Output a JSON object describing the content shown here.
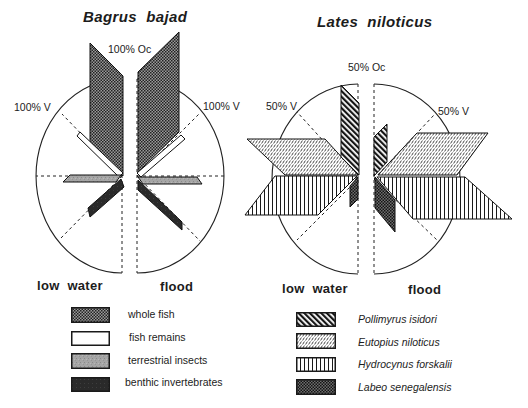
{
  "panels": {
    "bagrus": {
      "title": "Bagrus  bajad",
      "oc_label": "100% Oc",
      "v_label_left": "100% V",
      "v_label_right": "100% V",
      "season_left": "low  water",
      "season_right": "flood"
    },
    "lates": {
      "title": "Lates  niloticus",
      "oc_label": "50% Oc",
      "v_label_left": "50% V",
      "v_label_right": "50% V",
      "season_left": "low  water",
      "season_right": "flood"
    }
  },
  "legends": {
    "bagrus": [
      {
        "label": "whole fish",
        "pattern": "whole-fish"
      },
      {
        "label": "fish remains",
        "pattern": "fish-remains"
      },
      {
        "label": "terrestrial insects",
        "pattern": "terrestrial-insects"
      },
      {
        "label": "benthic invertebrates",
        "pattern": "benthic-invertebrates"
      }
    ],
    "lates": [
      {
        "label": "Pollimyrus isidori",
        "pattern": "pollimyrus-isidori"
      },
      {
        "label": "Eutopius niloticus",
        "pattern": "eutopius-niloticus"
      },
      {
        "label": "Hydrocynus forskalii",
        "pattern": "hydrocynus-forskalii"
      },
      {
        "label": "Labeo senegalensis",
        "pattern": "labeo-senegalensis"
      }
    ]
  },
  "chart_data": [
    {
      "id": "bagrus",
      "type": "bar",
      "subtype": "paired semicircular prey-importance diagram (polar parallelogram bars)",
      "title": "Bagrus bajad",
      "axis_labels": {
        "vertical": "100% Oc",
        "diagonal": "100% V"
      },
      "scale": {
        "Oc_max": 100,
        "V_max": 100
      },
      "halves": [
        {
          "season": "low water",
          "side": "left",
          "center": [
            122,
            176
          ],
          "rx": 86,
          "ry": 97,
          "rays": [
            [
              36,
              176
            ],
            [
              62,
              114
            ],
            [
              61,
              238
            ]
          ],
          "items": [
            {
              "category": "whole fish",
              "pattern": "whole-fish",
              "direction": "vertical (Oc axis)",
              "approx_extent_rel_radius": 1.4,
              "polygon": [
                [
                  90,
                  43
                ],
                [
                  123,
                  76
                ],
                [
                  123,
                  176
                ],
                [
                  90,
                  142
                ]
              ]
            },
            {
              "category": "fish remains",
              "pattern": "fish-remains",
              "direction": "45deg up",
              "approx_extent_rel_radius": 0.71,
              "polygon": [
                [
                  77,
                  136
                ],
                [
                  80,
                  132
                ],
                [
                  123,
                  173
                ],
                [
                  119,
                  177
                ]
              ]
            },
            {
              "category": "terrestrial insects",
              "pattern": "terrestrial-insects",
              "direction": "horizontal",
              "approx_extent_rel_radius": 0.69,
              "polygon": [
                [
                  70,
                  175
                ],
                [
                  121,
                  175
                ],
                [
                  116,
                  182
                ],
                [
                  63,
                  182
                ]
              ]
            },
            {
              "category": "benthic invertebrates",
              "pattern": "benthic-invertebrates",
              "direction": "45deg down",
              "approx_extent_rel_radius": 0.56,
              "polygon": [
                [
                  88,
                  208
                ],
                [
                  121,
                  179
                ],
                [
                  124,
                  187
                ],
                [
                  90,
                  217
                ]
              ]
            }
          ]
        },
        {
          "season": "flood",
          "side": "right",
          "center": [
            137,
            176
          ],
          "rx": 87,
          "ry": 97,
          "rays": [
            [
              224,
              176
            ],
            [
              200,
              113
            ],
            [
              200,
              241
            ]
          ],
          "items": [
            {
              "category": "whole fish",
              "pattern": "whole-fish",
              "direction": "vertical (Oc axis)",
              "approx_extent_rel_radius": 1.51,
              "polygon": [
                [
                  138,
                  72
                ],
                [
                  179,
                  32
                ],
                [
                  179,
                  132
                ],
                [
                  138,
                  172
                ]
              ]
            },
            {
              "category": "fish remains",
              "pattern": "fish-remains",
              "direction": "45deg up",
              "approx_extent_rel_radius": 0.71,
              "polygon": [
                [
                  137,
                  173
                ],
                [
                  181,
                  135
                ],
                [
                  185,
                  139
                ],
                [
                  141,
                  177
                ]
              ]
            },
            {
              "category": "terrestrial insects",
              "pattern": "terrestrial-insects",
              "direction": "horizontal",
              "approx_extent_rel_radius": 0.76,
              "polygon": [
                [
                  138,
                  177
                ],
                [
                  197,
                  177
                ],
                [
                  202,
                  184
                ],
                [
                  143,
                  184
                ]
              ]
            },
            {
              "category": "benthic invertebrates",
              "pattern": "benthic-invertebrates",
              "direction": "45deg down",
              "approx_extent_rel_radius": 0.77,
              "polygon": [
                [
                  138,
                  180
                ],
                [
                  182,
                  222
                ],
                [
                  182,
                  230
                ],
                [
                  138,
                  190
                ]
              ]
            }
          ]
        }
      ]
    },
    {
      "id": "lates",
      "type": "bar",
      "subtype": "paired semicircular prey-importance diagram (polar parallelogram bars)",
      "title": "Lates niloticus",
      "axis_labels": {
        "vertical": "50% Oc",
        "diagonal": "50% V"
      },
      "scale": {
        "Oc_max": 50,
        "V_max": 50
      },
      "halves": [
        {
          "season": "low water",
          "side": "left",
          "center": [
            358,
            179
          ],
          "rx": 86,
          "ry": 95,
          "rays": [
            [
              272,
              179
            ],
            [
              297,
              112
            ],
            [
              297,
              240
            ]
          ],
          "items": [
            {
              "category": "Eutopius niloticus",
              "pattern": "eutopius-niloticus",
              "direction": "upper horizontal band",
              "approx_extent_rel_radius": 1.29,
              "polygon": [
                [
                  247,
                  139
                ],
                [
                  325,
                  139
                ],
                [
                  358,
                  175
                ],
                [
                  285,
                  175
                ]
              ]
            },
            {
              "category": "Pollimyrus isidori",
              "pattern": "pollimyrus-isidori",
              "direction": "vertical (Oc axis)",
              "approx_extent_rel_radius": 0.99,
              "polygon": [
                [
                  341,
                  85
                ],
                [
                  359,
                  103
                ],
                [
                  359,
                  175
                ],
                [
                  341,
                  157
                ]
              ]
            },
            {
              "category": "Hydrocynus forskalii",
              "pattern": "hydrocynus-forskalii",
              "direction": "lower horizontal band",
              "approx_extent_rel_radius": 1.31,
              "polygon": [
                [
                  275,
                  176
                ],
                [
                  357,
                  176
                ],
                [
                  318,
                  215
                ],
                [
                  245,
                  215
                ]
              ]
            },
            {
              "category": "Labeo senegalensis",
              "pattern": "labeo-senegalensis",
              "direction": "vertical down",
              "approx_extent_rel_radius": 0.29,
              "polygon": [
                [
                  350,
                  186
                ],
                [
                  358,
                  177
                ],
                [
                  358,
                  199
                ],
                [
                  350,
                  207
                ]
              ]
            }
          ]
        },
        {
          "season": "flood",
          "side": "right",
          "center": [
            374,
            179
          ],
          "rx": 86,
          "ry": 95,
          "rays": [
            [
              460,
              179
            ],
            [
              434,
              115
            ],
            [
              438,
              241
            ]
          ],
          "items": [
            {
              "category": "Pollimyrus isidori",
              "pattern": "pollimyrus-isidori",
              "direction": "vertical (Oc axis)",
              "approx_extent_rel_radius": 0.58,
              "polygon": [
                [
                  374,
                  137
                ],
                [
                  387,
                  124
                ],
                [
                  387,
                  162
                ],
                [
                  374,
                  176
                ]
              ]
            },
            {
              "category": "Eutopius niloticus",
              "pattern": "eutopius-niloticus",
              "direction": "upper horizontal band",
              "approx_extent_rel_radius": 1.33,
              "polygon": [
                [
                  417,
                  133
                ],
                [
                  488,
                  133
                ],
                [
                  457,
                  175
                ],
                [
                  378,
                  175
                ]
              ]
            },
            {
              "category": "Hydrocynus forskalii",
              "pattern": "hydrocynus-forskalii",
              "direction": "lower horizontal band",
              "approx_extent_rel_radius": 1.6,
              "polygon": [
                [
                  377,
                  177
                ],
                [
                  465,
                  177
                ],
                [
                  512,
                  219
                ],
                [
                  413,
                  219
                ]
              ]
            },
            {
              "category": "Labeo senegalensis",
              "pattern": "labeo-senegalensis",
              "direction": "45deg down",
              "approx_extent_rel_radius": 0.56,
              "polygon": [
                [
                  375,
                  177
                ],
                [
                  395,
                  200
                ],
                [
                  395,
                  232
                ],
                [
                  375,
                  208
                ]
              ]
            }
          ]
        }
      ]
    }
  ]
}
